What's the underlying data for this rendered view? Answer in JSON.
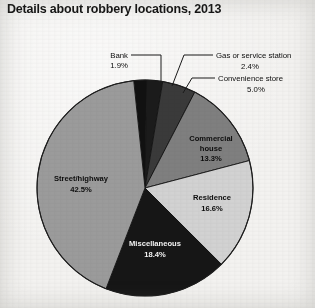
{
  "chart_data": {
    "type": "pie",
    "title": "Details about robbery locations, 2013",
    "xlabel": "",
    "ylabel": "",
    "legend_position": "none",
    "grid": false,
    "categories": [
      "Bank",
      "Gas or service station",
      "Convenience store",
      "Commercial house",
      "Residence",
      "Miscellaneous",
      "Street/highway"
    ],
    "values": [
      1.9,
      2.4,
      5.0,
      13.3,
      16.6,
      18.4,
      42.5
    ],
    "value_labels": [
      "1.9%",
      "2.4%",
      "5.0%",
      "13.3%",
      "16.6%",
      "18.4%",
      "42.5%"
    ],
    "units": "percent",
    "slices": [
      {
        "name": "Bank",
        "value": 1.9,
        "value_label": "1.9%",
        "color": "#111111",
        "label_placement": "callout",
        "label_text_color": "#0d0d0d"
      },
      {
        "name": "Gas or service station",
        "value": 2.4,
        "value_label": "2.4%",
        "color": "#1b1b1b",
        "label_placement": "callout",
        "label_text_color": "#0d0d0d"
      },
      {
        "name": "Convenience store",
        "value": 5.0,
        "value_label": "5.0%",
        "color": "#3a3a3a",
        "label_placement": "callout",
        "label_text_color": "#0d0d0d"
      },
      {
        "name": "Commercial house",
        "value": 13.3,
        "value_label": "13.3%",
        "color": "#7f7f7f",
        "label_placement": "inside",
        "label_text_color": "#0d0d0d"
      },
      {
        "name": "Residence",
        "value": 16.6,
        "value_label": "16.6%",
        "color": "#d2d2d2",
        "label_placement": "inside",
        "label_text_color": "#0d0d0d"
      },
      {
        "name": "Miscellaneous",
        "value": 18.4,
        "value_label": "18.4%",
        "color": "#161616",
        "label_placement": "inside",
        "label_text_color": "#f4f4f4"
      },
      {
        "name": "Street/highway",
        "value": 42.5,
        "value_label": "42.5%",
        "color": "#9b9b9b",
        "label_placement": "inside",
        "label_text_color": "#0d0d0d"
      }
    ]
  },
  "inside_labels": {
    "commercial_house": {
      "line1": "Commercial",
      "line2": "house",
      "line3": "13.3%"
    },
    "residence": {
      "line1": "Residence",
      "line2": "16.6%"
    },
    "miscellaneous": {
      "line1": "Miscellaneous",
      "line2": "18.4%"
    },
    "street_highway": {
      "line1": "Street/highway",
      "line2": "42.5%"
    }
  },
  "callouts": {
    "bank": {
      "name": "Bank",
      "value_label": "1.9%"
    },
    "gas_station": {
      "name": "Gas or service station",
      "value_label": "2.4%"
    },
    "convenience_store": {
      "name": "Convenience store",
      "value_label": "5.0%"
    }
  }
}
